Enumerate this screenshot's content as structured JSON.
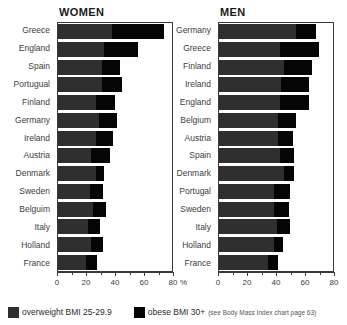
{
  "legend": {
    "overweight_label": "overweight BMI 25-29.9",
    "obese_label": "obese BMI 30+",
    "note": "(see Body Mass Index chart page 63)",
    "overweight_color": "#2f2f2f",
    "obese_color": "#050505"
  },
  "axis_unit": "%",
  "chart_data": [
    {
      "type": "bar",
      "title": "WOMEN",
      "orientation": "horizontal",
      "stacked": true,
      "xlabel": "%",
      "ylabel": "",
      "xlim": [
        0,
        80
      ],
      "ticks": [
        0,
        20,
        40,
        60,
        80
      ],
      "tick_labels": [
        "0",
        "20",
        "40",
        "60",
        "80"
      ],
      "grid": false,
      "legend_position": "bottom",
      "categories": [
        "Greece",
        "England",
        "Spain",
        "Portugual",
        "Finland",
        "Germany",
        "Ireland",
        "Austria",
        "Denmark",
        "Sweden",
        "Belguim",
        "Italy",
        "Holland",
        "France"
      ],
      "series": [
        {
          "name": "overweight BMI 25-29.9",
          "color": "#2f2f2f",
          "values": [
            37,
            32,
            30,
            30,
            26,
            28,
            26,
            23,
            26,
            22,
            24,
            21,
            23,
            19
          ]
        },
        {
          "name": "obese BMI 30+",
          "color": "#050505",
          "values": [
            36,
            23,
            13,
            14,
            13,
            13,
            12,
            13,
            6,
            9,
            9,
            8,
            8,
            8
          ]
        }
      ]
    },
    {
      "type": "bar",
      "title": "MEN",
      "orientation": "horizontal",
      "stacked": true,
      "xlabel": "",
      "ylabel": "",
      "xlim": [
        0,
        80
      ],
      "ticks": [
        0,
        20,
        40,
        60,
        80
      ],
      "tick_labels": [
        "0",
        "20",
        "40",
        "60",
        "80"
      ],
      "grid": false,
      "legend_position": "bottom",
      "categories": [
        "Germany",
        "Greece",
        "Finland",
        "Ireland",
        "England",
        "Belgium",
        "Austria",
        "Spain",
        "Denmark",
        "Portugal",
        "Sweden",
        "Italy",
        "Holland",
        "France"
      ],
      "series": [
        {
          "name": "overweight BMI 25-29.9",
          "color": "#2f2f2f",
          "values": [
            53,
            42,
            45,
            43,
            42,
            41,
            41,
            42,
            45,
            38,
            38,
            40,
            38,
            34
          ]
        },
        {
          "name": "obese BMI 30+",
          "color": "#050505",
          "values": [
            14,
            27,
            19,
            19,
            20,
            12,
            10,
            10,
            7,
            11,
            10,
            9,
            6,
            7
          ]
        }
      ]
    }
  ]
}
